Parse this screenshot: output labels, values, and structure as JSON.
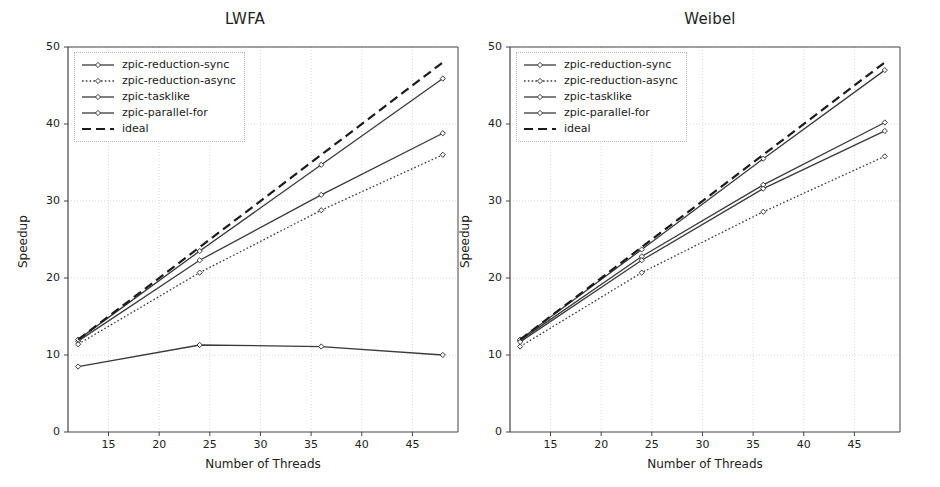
{
  "figure": {
    "width": 940,
    "height": 487,
    "background": "#ffffff",
    "panel_count": 2
  },
  "style": {
    "line_color": "#3a3a3a",
    "ideal_color": "#1c1c1c",
    "grid_color": "#cfcfcf",
    "axis_color": "#444444",
    "text_color": "#1a1a1a"
  },
  "chart_data": [
    {
      "type": "line",
      "title": "LWFA",
      "xlabel": "Number of Threads",
      "ylabel": "Speedup",
      "xlim": [
        11,
        49.5
      ],
      "ylim": [
        0,
        50
      ],
      "xticks": [
        15,
        20,
        25,
        30,
        35,
        40,
        45
      ],
      "yticks": [
        0,
        10,
        20,
        30,
        40,
        50
      ],
      "grid": true,
      "legend_position": "upper left",
      "x": [
        12,
        24,
        36,
        48
      ],
      "series": [
        {
          "name": "zpic-reduction-sync",
          "values": [
            11.8,
            22.3,
            30.8,
            38.8
          ],
          "linestyle": "solid",
          "marker": "diamond"
        },
        {
          "name": "zpic-reduction-async",
          "values": [
            11.4,
            20.7,
            28.8,
            36.0
          ],
          "linestyle": "dotted",
          "marker": "diamond"
        },
        {
          "name": "zpic-tasklike",
          "values": [
            12.0,
            23.5,
            34.7,
            45.9
          ],
          "linestyle": "solid",
          "marker": "diamond"
        },
        {
          "name": "zpic-parallel-for",
          "values": [
            8.5,
            11.3,
            11.1,
            10.0
          ],
          "linestyle": "solid",
          "marker": "diamond"
        },
        {
          "name": "ideal",
          "values": [
            12.0,
            24.0,
            36.0,
            48.0
          ],
          "linestyle": "dashed",
          "marker": "none"
        }
      ]
    },
    {
      "type": "line",
      "title": "Weibel",
      "xlabel": "Number of Threads",
      "ylabel": "Speedup",
      "xlim": [
        11,
        49.5
      ],
      "ylim": [
        0,
        50
      ],
      "xticks": [
        15,
        20,
        25,
        30,
        35,
        40,
        45
      ],
      "yticks": [
        0,
        10,
        20,
        30,
        40,
        50
      ],
      "grid": true,
      "legend_position": "upper left",
      "x": [
        12,
        24,
        36,
        48
      ],
      "series": [
        {
          "name": "zpic-reduction-sync",
          "values": [
            11.9,
            22.8,
            32.1,
            40.2
          ],
          "linestyle": "solid",
          "marker": "diamond"
        },
        {
          "name": "zpic-reduction-async",
          "values": [
            11.1,
            20.7,
            28.6,
            35.8
          ],
          "linestyle": "dotted",
          "marker": "diamond"
        },
        {
          "name": "zpic-tasklike",
          "values": [
            12.0,
            23.7,
            35.5,
            47.0
          ],
          "linestyle": "solid",
          "marker": "diamond"
        },
        {
          "name": "zpic-parallel-for",
          "values": [
            11.7,
            22.3,
            31.6,
            39.1
          ],
          "linestyle": "solid",
          "marker": "diamond"
        },
        {
          "name": "ideal",
          "values": [
            12.0,
            24.0,
            36.0,
            48.0
          ],
          "linestyle": "dashed",
          "marker": "none"
        }
      ]
    }
  ]
}
